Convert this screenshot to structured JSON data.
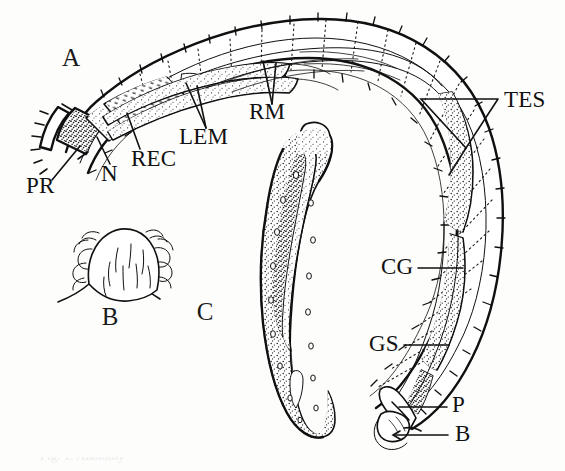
{
  "figure": {
    "kind": "scientific-line-drawing",
    "background_color": "#fdfdfc",
    "ink_color": "#111111",
    "width": 565,
    "height": 471,
    "clipped_caption": "Fig. 1. Anatomy"
  },
  "panels": [
    {
      "id": "A",
      "label": "A",
      "x": 62,
      "y": 66,
      "description": "whole curved body, lateral view"
    },
    {
      "id": "B",
      "label": "B",
      "x": 110,
      "y": 325,
      "description": "enlarged knob with setae and hooks"
    },
    {
      "id": "C",
      "label": "C",
      "x": 205,
      "y": 320,
      "description": "isolated elongate sac organ"
    }
  ],
  "annotations": [
    {
      "abbr": "PR",
      "text": "PR",
      "x": 26,
      "y": 193,
      "anchor": "start",
      "leader": "single",
      "target": "anterior proboscis"
    },
    {
      "abbr": "N",
      "text": "N",
      "x": 101,
      "y": 181,
      "anchor": "start",
      "leader": "single",
      "target": "neck region"
    },
    {
      "abbr": "REC",
      "text": "REC",
      "x": 131,
      "y": 166,
      "anchor": "start",
      "leader": "single",
      "target": "receptacle"
    },
    {
      "abbr": "LEM",
      "text": "LEM",
      "x": 179,
      "y": 144,
      "anchor": "start",
      "leader": "forked",
      "target": "lemnisci"
    },
    {
      "abbr": "RM",
      "text": "RM",
      "x": 249,
      "y": 119,
      "anchor": "start",
      "leader": "forked",
      "target": "retractor muscles"
    },
    {
      "abbr": "TES",
      "text": "TES",
      "x": 504,
      "y": 107,
      "anchor": "start",
      "leader": "triangle",
      "target": "testes"
    },
    {
      "abbr": "CG",
      "text": "CG",
      "x": 381,
      "y": 274,
      "anchor": "start",
      "leader": "single",
      "target": "cement glands"
    },
    {
      "abbr": "GS",
      "text": "GS",
      "x": 369,
      "y": 351,
      "anchor": "start",
      "leader": "single",
      "target": "genital sheath"
    },
    {
      "abbr": "P",
      "text": "P",
      "x": 452,
      "y": 412,
      "anchor": "start",
      "leader": "single",
      "target": "penis"
    },
    {
      "abbr": "B",
      "text": "B",
      "x": 455,
      "y": 441,
      "anchor": "start",
      "leader": "arrow",
      "target": "bursa"
    }
  ],
  "legend_note": {
    "abbreviations": [
      "PR = proboscis",
      "N = neck",
      "REC = receptacle",
      "LEM = lemnisci",
      "RM = retractor muscle",
      "TES = testes",
      "CG = cement glands",
      "GS = genital sheath",
      "P = penis",
      "B = bursa"
    ]
  }
}
